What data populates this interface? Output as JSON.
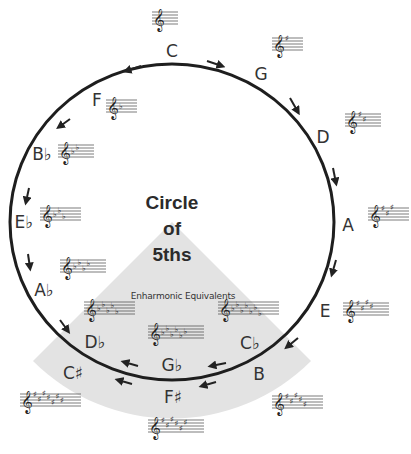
{
  "title": {
    "lines": [
      "Circle",
      "of",
      "5ths"
    ]
  },
  "enharmonic_label": "Enharmonic Equivalents",
  "colors": {
    "circle_stroke": "#1e1e1e",
    "wedge_fill": "#e3e3e3",
    "text": "#333333",
    "background": "#ffffff"
  },
  "keys": [
    {
      "name": "C",
      "label": "C",
      "label_pos": [
        172,
        52
      ],
      "staff_pos": [
        152,
        12
      ],
      "accidental": "none",
      "count": 0
    },
    {
      "name": "G",
      "label": "G",
      "label_pos": [
        261,
        75
      ],
      "staff_pos": [
        272,
        38
      ],
      "accidental": "sharp",
      "count": 1
    },
    {
      "name": "D",
      "label": "D",
      "label_pos": [
        323,
        138
      ],
      "staff_pos": [
        345,
        114
      ],
      "accidental": "sharp",
      "count": 2
    },
    {
      "name": "A",
      "label": "A",
      "label_pos": [
        348,
        226
      ],
      "staff_pos": [
        368,
        208
      ],
      "accidental": "sharp",
      "count": 3
    },
    {
      "name": "E",
      "label": "E",
      "label_pos": [
        325,
        312
      ],
      "staff_pos": [
        343,
        303
      ],
      "accidental": "sharp",
      "count": 4
    },
    {
      "name": "B",
      "label": "B",
      "label_pos": [
        259,
        375
      ],
      "staff_pos": [
        272,
        396
      ],
      "accidental": "sharp",
      "count": 5
    },
    {
      "name": "F#",
      "label": "F♯",
      "label_pos": [
        173,
        398
      ],
      "staff_pos": [
        148,
        420
      ],
      "accidental": "sharp",
      "count": 6
    },
    {
      "name": "C#",
      "label": "C♯",
      "label_pos": [
        73,
        374
      ],
      "staff_pos": [
        20,
        394
      ],
      "accidental": "sharp",
      "count": 7
    },
    {
      "name": "Db",
      "label": "D♭",
      "label_pos": [
        95,
        343
      ],
      "staff_pos": [
        84,
        302
      ],
      "accidental": "flat",
      "count": 5
    },
    {
      "name": "Gb",
      "label": "G♭",
      "label_pos": [
        172,
        366
      ],
      "staff_pos": [
        148,
        326
      ],
      "accidental": "flat",
      "count": 6
    },
    {
      "name": "Cb",
      "label": "C♭",
      "label_pos": [
        250,
        344
      ],
      "staff_pos": [
        218,
        302
      ],
      "accidental": "flat",
      "count": 7
    },
    {
      "name": "Ab",
      "label": "A♭",
      "label_pos": [
        44,
        291
      ],
      "staff_pos": [
        60,
        260
      ],
      "accidental": "flat",
      "count": 4
    },
    {
      "name": "Eb",
      "label": "E♭",
      "label_pos": [
        24,
        223
      ],
      "staff_pos": [
        40,
        208
      ],
      "accidental": "flat",
      "count": 3
    },
    {
      "name": "Bb",
      "label": "B♭",
      "label_pos": [
        42,
        155
      ],
      "staff_pos": [
        58,
        145
      ],
      "accidental": "flat",
      "count": 2
    },
    {
      "name": "F",
      "label": "F",
      "label_pos": [
        97,
        101
      ],
      "staff_pos": [
        106,
        100
      ],
      "accidental": "flat",
      "count": 1
    }
  ],
  "arrows": [
    {
      "id": "C-G",
      "from": [
        207,
        61
      ],
      "to": [
        222,
        66
      ]
    },
    {
      "id": "G-D",
      "from": [
        290,
        98
      ],
      "to": [
        298,
        112
      ]
    },
    {
      "id": "D-A",
      "from": [
        333,
        168
      ],
      "to": [
        336,
        183
      ]
    },
    {
      "id": "A-E",
      "from": [
        336,
        260
      ],
      "to": [
        332,
        274
      ]
    },
    {
      "id": "E-B",
      "from": [
        298,
        338
      ],
      "to": [
        287,
        347
      ]
    },
    {
      "id": "B-Gb",
      "from": [
        226,
        363
      ],
      "to": [
        211,
        366
      ]
    },
    {
      "id": "Gb-F#-back",
      "from": [
        216,
        382
      ],
      "to": [
        202,
        386
      ]
    },
    {
      "id": "Gb-Db",
      "from": [
        138,
        366
      ],
      "to": [
        124,
        362
      ]
    },
    {
      "id": "F#-C#-back",
      "from": [
        132,
        384
      ],
      "to": [
        118,
        380
      ]
    },
    {
      "id": "Db-Ab",
      "from": [
        60,
        320
      ],
      "to": [
        68,
        331
      ]
    },
    {
      "id": "Ab-Eb",
      "from": [
        28,
        254
      ],
      "to": [
        30,
        268
      ]
    },
    {
      "id": "Eb-Bb",
      "from": [
        29,
        188
      ],
      "to": [
        26,
        202
      ]
    },
    {
      "id": "Bb-F",
      "from": [
        70,
        119
      ],
      "to": [
        59,
        127
      ]
    },
    {
      "id": "F-C",
      "from": [
        141,
        66
      ],
      "to": [
        126,
        71
      ]
    }
  ]
}
